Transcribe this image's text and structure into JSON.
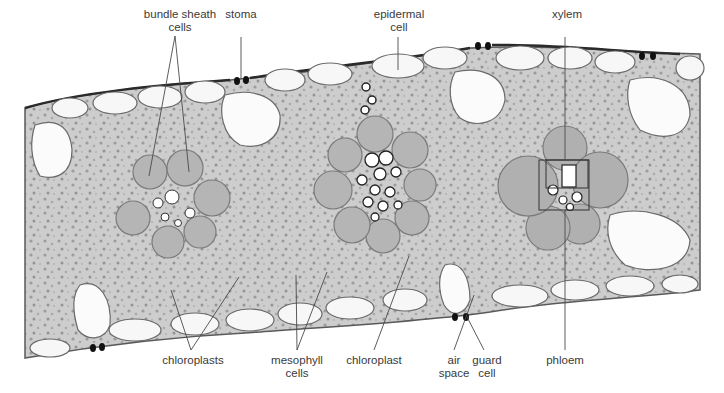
{
  "figure": {
    "colors": {
      "background": "#ffffff",
      "tissue_fill": "#cfcfcf",
      "tissue_dark": "#9a9a9a",
      "cell_wall": "#5a5a5a",
      "cuticle": "#2a2a2a",
      "cell_lumen": "#f7f7f7",
      "guard_cell": "#111111",
      "leader_line": "#4a4a4a",
      "label_text": "#3a3a3a"
    }
  },
  "labels": {
    "top": [
      {
        "id": "bundle-sheath-cells",
        "text": "bundle sheath\ncells",
        "x": 180,
        "y": 8
      },
      {
        "id": "stoma",
        "text": "stoma",
        "x": 241,
        "y": 8
      },
      {
        "id": "epidermal-cell",
        "text": "epidermal\ncell",
        "x": 399,
        "y": 8
      },
      {
        "id": "xylem",
        "text": "xylem",
        "x": 567,
        "y": 8
      }
    ],
    "bottom": [
      {
        "id": "chloroplasts",
        "text": "chloroplasts",
        "x": 193,
        "y": 354
      },
      {
        "id": "mesophyll-cells",
        "text": "mesophyll\ncells",
        "x": 297,
        "y": 354
      },
      {
        "id": "chloroplast",
        "text": "chloroplast",
        "x": 374,
        "y": 354
      },
      {
        "id": "air-space",
        "text": "air\nspace",
        "x": 454,
        "y": 354
      },
      {
        "id": "guard-cell",
        "text": "guard\ncell",
        "x": 487,
        "y": 354
      },
      {
        "id": "phloem",
        "text": "phloem",
        "x": 565,
        "y": 354
      }
    ]
  },
  "leader_lines": [
    {
      "label": "bundle-sheath-cells",
      "x1": 175,
      "y1": 36,
      "x2": 149,
      "y2": 176
    },
    {
      "label": "bundle-sheath-cells",
      "x1": 175,
      "y1": 36,
      "x2": 189,
      "y2": 172
    },
    {
      "label": "stoma",
      "x1": 241,
      "y1": 37,
      "x2": 241,
      "y2": 79
    },
    {
      "label": "epidermal-cell",
      "x1": 398,
      "y1": 37,
      "x2": 398,
      "y2": 70
    },
    {
      "label": "xylem",
      "x1": 565,
      "y1": 37,
      "x2": 565,
      "y2": 160
    },
    {
      "label": "chloroplasts",
      "x1": 191,
      "y1": 350,
      "x2": 171,
      "y2": 290
    },
    {
      "label": "chloroplasts",
      "x1": 191,
      "y1": 350,
      "x2": 239,
      "y2": 277
    },
    {
      "label": "mesophyll-cells",
      "x1": 297,
      "y1": 350,
      "x2": 296,
      "y2": 275
    },
    {
      "label": "mesophyll-cells",
      "x1": 297,
      "y1": 350,
      "x2": 327,
      "y2": 272
    },
    {
      "label": "chloroplast",
      "x1": 374,
      "y1": 350,
      "x2": 409,
      "y2": 256
    },
    {
      "label": "air-space",
      "x1": 454,
      "y1": 350,
      "x2": 474,
      "y2": 295
    },
    {
      "label": "guard-cell",
      "x1": 484,
      "y1": 350,
      "x2": 466,
      "y2": 315
    },
    {
      "label": "phloem",
      "x1": 565,
      "y1": 350,
      "x2": 565,
      "y2": 210
    }
  ],
  "phloem_box": {
    "x": 539,
    "y": 160,
    "w": 50,
    "h": 50
  },
  "xylem_box": {
    "x": 546,
    "y": 160,
    "w": 42,
    "h": 28
  }
}
